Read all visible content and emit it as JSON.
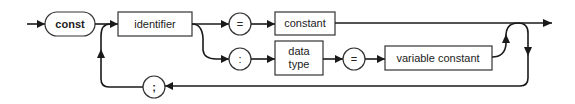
{
  "diagram": {
    "type": "syntax-diagram",
    "keyword": "const",
    "nodes": {
      "const": "const",
      "identifier": "identifier",
      "equals_1": "=",
      "constant": "constant",
      "colon": ":",
      "data_type_line1": "data",
      "data_type_line2": "type",
      "equals_2": "=",
      "variable_constant": "variable constant",
      "semicolon": ";"
    },
    "edges": [
      {
        "from": "entry",
        "to": "const"
      },
      {
        "from": "const",
        "to": "identifier"
      },
      {
        "from": "identifier",
        "to": "equals_1"
      },
      {
        "from": "equals_1",
        "to": "constant"
      },
      {
        "from": "constant",
        "to": "exit"
      },
      {
        "from": "identifier",
        "to": "colon"
      },
      {
        "from": "colon",
        "to": "data_type"
      },
      {
        "from": "data_type",
        "to": "equals_2"
      },
      {
        "from": "equals_2",
        "to": "variable_constant"
      },
      {
        "from": "variable_constant",
        "to": "exit"
      },
      {
        "from": "exit",
        "to": "semicolon"
      },
      {
        "from": "semicolon",
        "to": "identifier"
      }
    ]
  }
}
